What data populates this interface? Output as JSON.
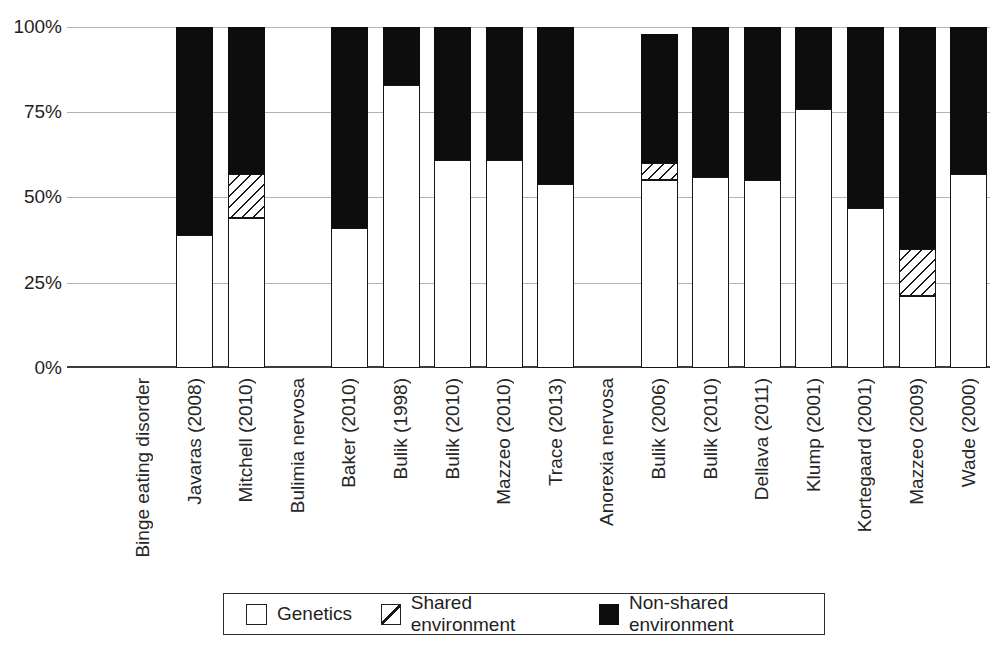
{
  "chart_data": {
    "type": "bar",
    "stacked": true,
    "title": "",
    "xlabel": "",
    "ylabel": "",
    "ylim": [
      0,
      100
    ],
    "grid": "horizontal",
    "legend_position": "bottom",
    "yticks": [
      "0%",
      "25%",
      "50%",
      "75%",
      "100%"
    ],
    "categories": [
      "Binge eating disorder",
      "Javaras (2008)",
      "Mitchell (2010)",
      "Bulimia nervosa",
      "Baker (2010)",
      "Bulik (1998)",
      "Bulik (2010)",
      "Mazzeo (2010)",
      "Trace (2013)",
      "Anorexia nervosa",
      "Bulik (2006)",
      "Bulik (2010)",
      "Dellava (2011)",
      "Klump (2001)",
      "Kortegaard (2001)",
      "Mazzeo (2009)",
      "Wade (2000)"
    ],
    "group_headers": [
      "Binge eating disorder",
      "Bulimia nervosa",
      "Anorexia nervosa"
    ],
    "series": [
      {
        "name": "Genetics",
        "style": "white",
        "values": [
          null,
          39,
          44,
          null,
          41,
          83,
          61,
          61,
          54,
          null,
          55,
          56,
          55,
          76,
          47,
          21,
          57
        ]
      },
      {
        "name": "Shared environment",
        "style": "hatched",
        "values": [
          null,
          0,
          13,
          null,
          0,
          0,
          0,
          0,
          0,
          null,
          5,
          0,
          0,
          0,
          0,
          14,
          0
        ]
      },
      {
        "name": "Non-shared environment",
        "style": "black",
        "values": [
          null,
          61,
          43,
          null,
          59,
          17,
          39,
          39,
          46,
          null,
          38,
          44,
          45,
          24,
          53,
          65,
          43
        ]
      }
    ],
    "colors": {
      "bar_outline": "#161616",
      "non_shared_fill": "#0d0d0d",
      "gridline": "#b3b3b3",
      "baseline": "#3d3d3d"
    }
  }
}
